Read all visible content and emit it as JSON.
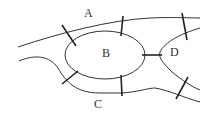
{
  "diagram": {
    "type": "bridges-of-konigsberg",
    "regions": [
      {
        "id": "A",
        "label": "A"
      },
      {
        "id": "B",
        "label": "B"
      },
      {
        "id": "C",
        "label": "C"
      },
      {
        "id": "D",
        "label": "D"
      }
    ],
    "bridges": [
      {
        "from": "A",
        "to": "B"
      },
      {
        "from": "A",
        "to": "B"
      },
      {
        "from": "A",
        "to": "D"
      },
      {
        "from": "B",
        "to": "C"
      },
      {
        "from": "B",
        "to": "C"
      },
      {
        "from": "B",
        "to": "D"
      },
      {
        "from": "C",
        "to": "D"
      }
    ],
    "colors": {
      "line": "#333333",
      "background": "#ffffff"
    }
  }
}
